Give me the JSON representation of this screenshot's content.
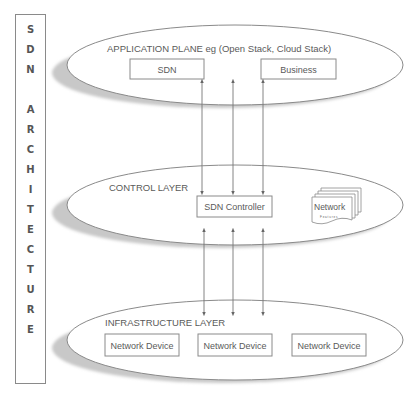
{
  "diagram": {
    "side_label": {
      "text": "SDN ARCHITECTURE",
      "letters": [
        "S",
        "D",
        "N",
        "",
        "A",
        "R",
        "C",
        "H",
        "I",
        "T",
        "E",
        "C",
        "T",
        "U",
        "R",
        "E"
      ]
    },
    "layers": [
      {
        "name": "application",
        "title": "APPLICATION PLANE eg (Open Stack, Cloud Stack)",
        "boxes": [
          "SDN",
          "Business"
        ]
      },
      {
        "name": "control",
        "title": "CONTROL LAYER",
        "boxes": [
          "SDN Controller"
        ],
        "stack": {
          "title": "Network",
          "subtitle": "Features"
        }
      },
      {
        "name": "infrastructure",
        "title": "INFRASTRUCTURE LAYER",
        "boxes": [
          "Network Device",
          "Network Device",
          "Network Device"
        ]
      }
    ],
    "connections": [
      {
        "from": "application",
        "to": "control",
        "count": 3,
        "direction": "bidirectional"
      },
      {
        "from": "control",
        "to": "infrastructure",
        "count": 3,
        "direction": "bidirectional"
      }
    ],
    "colors": {
      "line": "#8a8a8a",
      "shadow": "#c8c8c8",
      "text": "#5a5a5a",
      "arrow": "#666666"
    }
  }
}
